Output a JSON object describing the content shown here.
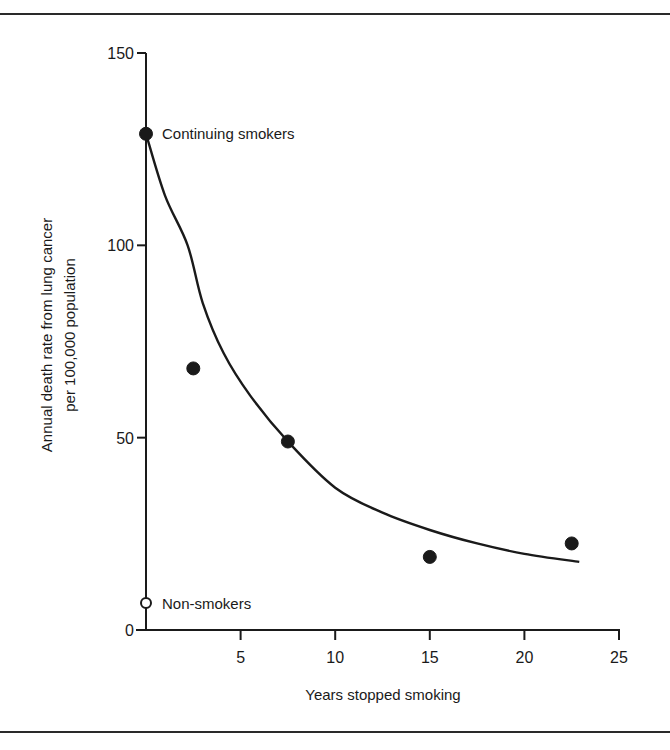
{
  "chart_data": {
    "type": "scatter",
    "title": "",
    "xlabel": "Years stopped smoking",
    "ylabel": [
      "Annual death rate from lung cancer",
      "per 100,000 population"
    ],
    "xlim": [
      0,
      25
    ],
    "ylim": [
      0,
      150
    ],
    "x_ticks": [
      5,
      10,
      15,
      20,
      25
    ],
    "x_tick_labels": [
      "5",
      "10",
      "15",
      "20",
      "25"
    ],
    "y_ticks": [
      0,
      50,
      100,
      150
    ],
    "y_tick_labels": [
      "0",
      "50",
      "100",
      "150"
    ],
    "grid": false,
    "legend": null,
    "series": [
      {
        "name": "Ex-smokers / continuing smokers",
        "marker": "filled-circle",
        "points": [
          {
            "x": 0,
            "y": 129
          },
          {
            "x": 2.5,
            "y": 68
          },
          {
            "x": 7.5,
            "y": 49
          },
          {
            "x": 15,
            "y": 19
          },
          {
            "x": 22.5,
            "y": 22.5
          }
        ]
      },
      {
        "name": "Non-smokers",
        "marker": "open-circle",
        "points": [
          {
            "x": 0,
            "y": 7
          }
        ]
      },
      {
        "name": "Fitted curve",
        "type": "line",
        "points": [
          {
            "x": 0,
            "y": 129
          },
          {
            "x": 1,
            "y": 113
          },
          {
            "x": 2.2,
            "y": 100
          },
          {
            "x": 3,
            "y": 85
          },
          {
            "x": 4.1,
            "y": 72
          },
          {
            "x": 5.5,
            "y": 61
          },
          {
            "x": 7.5,
            "y": 49
          },
          {
            "x": 10,
            "y": 37
          },
          {
            "x": 12.5,
            "y": 30.5
          },
          {
            "x": 15,
            "y": 26
          },
          {
            "x": 17.5,
            "y": 22.5
          },
          {
            "x": 20,
            "y": 19.8
          },
          {
            "x": 22.9,
            "y": 17.7
          }
        ]
      }
    ],
    "annotations": [
      {
        "text": "Continuing smokers",
        "x": 0,
        "y": 129
      },
      {
        "text": "Non-smokers",
        "x": 0,
        "y": 7
      }
    ]
  },
  "labels": {
    "continuing_smokers": "Continuing smokers",
    "non_smokers": "Non-smokers",
    "xlabel": "Years stopped smoking",
    "ylabel_line1": "Annual death rate from lung cancer",
    "ylabel_line2": "per 100,000 population"
  },
  "colors": {
    "ink": "#1a1a1a",
    "background": "#ffffff"
  }
}
